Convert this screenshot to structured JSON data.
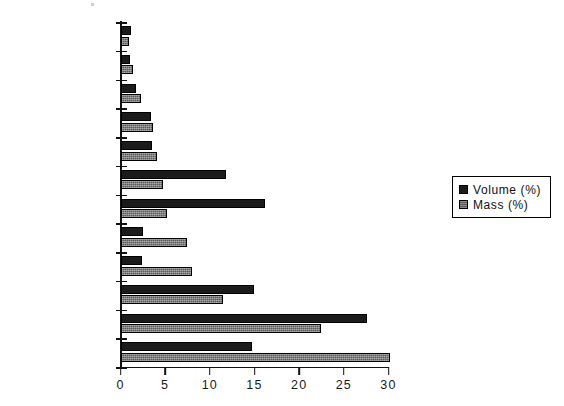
{
  "chart_data": {
    "type": "bar",
    "orientation": "horizontal",
    "title": "",
    "xlabel": "",
    "ylabel": "",
    "xlim": [
      0,
      30
    ],
    "xticks": [
      0,
      5,
      10,
      15,
      20,
      25,
      30
    ],
    "grid": false,
    "legend_position": "right",
    "categories": [
      "non-ferro metals",
      "hazardous waste",
      "wood, leather,\nrubber",
      "textiles",
      "ferro metals",
      "plastic cases",
      "plastic foils",
      "mineral waste",
      "glass",
      "plastic\ncompounds",
      "paper, cardboard",
      "biowaste"
    ],
    "series": [
      {
        "name": "Volume (%)",
        "color": "#1b1b1b",
        "values": [
          1.2,
          1.1,
          1.7,
          3.4,
          3.5,
          11.8,
          16.2,
          2.5,
          2.4,
          14.9,
          27.6,
          14.7
        ]
      },
      {
        "name": "Mass (%)",
        "color": "#5a5a5a",
        "values": [
          0.9,
          1.4,
          2.3,
          3.6,
          4.1,
          4.8,
          5.2,
          7.4,
          8.0,
          11.5,
          22.4,
          30.2
        ]
      }
    ]
  },
  "legend": {
    "entries": [
      {
        "label": "Volume (%)",
        "swatch": "black-square-icon"
      },
      {
        "label": "Mass (%)",
        "swatch": "gray-square-icon"
      }
    ]
  }
}
